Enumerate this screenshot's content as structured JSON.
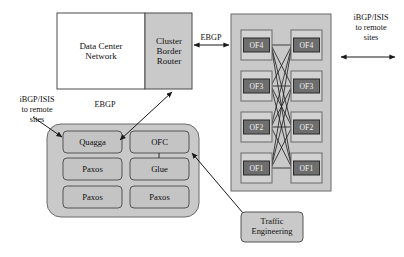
{
  "diagram": {
    "colors": {
      "shaded_fill": "#c9c9c9",
      "light_fill": "#d2d2d2",
      "module_fill": "#c4c4c4",
      "switch_inner_fill": "#6e6e6e",
      "white_fill": "#ffffff",
      "stroke": "#4a4a4a",
      "dark_stroke": "#1a1a1a",
      "text": "#101010",
      "switch_text": "#f2f2f2"
    },
    "data_center_network": {
      "label": "Data Center\nNetwork",
      "line1": "Data Center",
      "line2": "Network"
    },
    "cluster_border_router": {
      "line1": "Cluster",
      "line2": "Border",
      "line3": "Router"
    },
    "annotations": {
      "left_remote": {
        "line1": "iBGP/ISIS",
        "line2": "to remote",
        "line3": "sites"
      },
      "right_remote": {
        "line1": "iBGP/ISIS",
        "line2": "to remote",
        "line3": "sites"
      },
      "ebgp_top": "EBGP",
      "ebgp_left": "EBGP"
    },
    "switch_fabric": {
      "left_column": [
        {
          "label": "OF4"
        },
        {
          "label": "OF3"
        },
        {
          "label": "OF2"
        },
        {
          "label": "OF1"
        }
      ],
      "right_column": [
        {
          "label": "OF4"
        },
        {
          "label": "OF3"
        },
        {
          "label": "OF2"
        },
        {
          "label": "OF1"
        }
      ]
    },
    "controller": {
      "modules": [
        {
          "label": "Quagga",
          "column": "left",
          "row": 1
        },
        {
          "label": "OFC",
          "column": "right",
          "row": 1
        },
        {
          "label": "Paxos",
          "column": "left",
          "row": 2
        },
        {
          "label": "Glue",
          "column": "right",
          "row": 2
        },
        {
          "label": "Paxos",
          "column": "left",
          "row": 3
        },
        {
          "label": "Paxos",
          "column": "right",
          "row": 3
        }
      ]
    },
    "traffic_engineering": {
      "line1": "Traffic",
      "line2": "Engineering"
    }
  }
}
